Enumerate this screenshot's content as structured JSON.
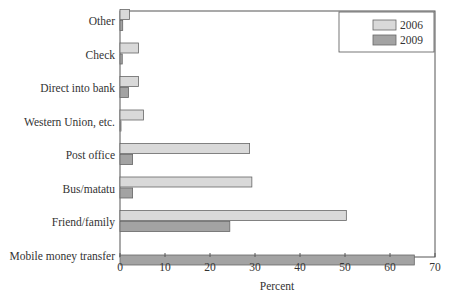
{
  "chart_data": {
    "type": "bar",
    "orientation": "horizontal",
    "title": "",
    "xlabel": "Percent",
    "ylabel": "",
    "xlim": [
      0,
      70
    ],
    "xticks": [
      0,
      10,
      20,
      30,
      40,
      50,
      60,
      70
    ],
    "grid": false,
    "legend_position": "top-right",
    "categories": [
      "Other",
      "Check",
      "Direct into bank",
      "Western Union, etc.",
      "Post office",
      "Bus/matatu",
      "Friend/family",
      "Mobile money transfer"
    ],
    "series": [
      {
        "name": "2006",
        "color": "#d9d9d9",
        "values": [
          2.1,
          4.1,
          4.1,
          5.2,
          28.8,
          29.3,
          50.3,
          0
        ]
      },
      {
        "name": "2009",
        "color": "#a3a3a3",
        "values": [
          0.6,
          0.5,
          1.9,
          0.2,
          2.8,
          2.8,
          24.4,
          65.4
        ]
      }
    ]
  }
}
